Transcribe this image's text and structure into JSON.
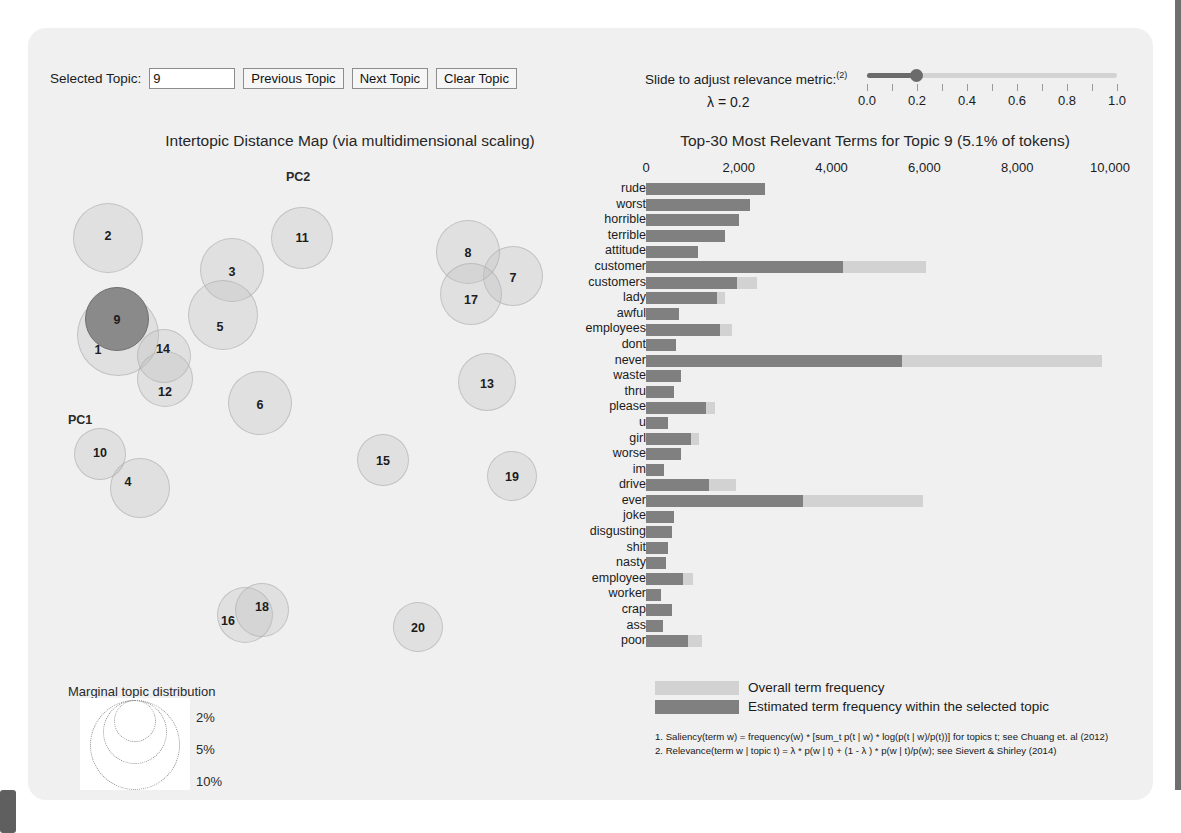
{
  "controls": {
    "selected_topic_label": "Selected Topic:",
    "selected_topic_value": "9",
    "previous_topic": "Previous Topic",
    "next_topic": "Next Topic",
    "clear_topic": "Clear Topic"
  },
  "slider": {
    "caption": "Slide to adjust relevance metric:",
    "caption_sup": "(2)",
    "lambda_text": "λ = 0.2",
    "value": 0.2,
    "min": 0.0,
    "max": 1.0,
    "ticks": [
      "0.0",
      "0.2",
      "0.4",
      "0.6",
      "0.8",
      "1.0"
    ],
    "tick_values": [
      0.0,
      0.1,
      0.2,
      0.3,
      0.4,
      0.5,
      0.6,
      0.7,
      0.8,
      0.9,
      1.0
    ],
    "fill_color": "#6b6b6b",
    "track_color": "#d3d3d3"
  },
  "map": {
    "title": "Intertopic Distance Map (via multidimensional scaling)",
    "axis_x_label": "PC1",
    "axis_y_label": "PC2",
    "selected_topic": 9,
    "selected_color": "#8a8a8a",
    "bubble_color": "rgba(190,190,190,0.30)",
    "topics": [
      {
        "id": 1,
        "cx": 78,
        "cy": 175,
        "r": 41,
        "lx": 58,
        "ly": 190
      },
      {
        "id": 2,
        "cx": 68,
        "cy": 78,
        "r": 35,
        "lx": 68,
        "ly": 76
      },
      {
        "id": 3,
        "cx": 192,
        "cy": 110,
        "r": 32,
        "lx": 192,
        "ly": 112
      },
      {
        "id": 4,
        "cx": 100,
        "cy": 328,
        "r": 30,
        "lx": 88,
        "ly": 322
      },
      {
        "id": 5,
        "cx": 183,
        "cy": 155,
        "r": 35,
        "lx": 180,
        "ly": 167
      },
      {
        "id": 6,
        "cx": 220,
        "cy": 243,
        "r": 32,
        "lx": 220,
        "ly": 245
      },
      {
        "id": 7,
        "cx": 473,
        "cy": 116,
        "r": 30,
        "lx": 473,
        "ly": 118
      },
      {
        "id": 8,
        "cx": 428,
        "cy": 92,
        "r": 32,
        "lx": 428,
        "ly": 93
      },
      {
        "id": 9,
        "cx": 77,
        "cy": 159,
        "r": 32,
        "lx": 77,
        "ly": 160
      },
      {
        "id": 10,
        "cx": 60,
        "cy": 294,
        "r": 26,
        "lx": 60,
        "ly": 293
      },
      {
        "id": 11,
        "cx": 262,
        "cy": 78,
        "r": 31,
        "lx": 262,
        "ly": 78
      },
      {
        "id": 12,
        "cx": 125,
        "cy": 219,
        "r": 28,
        "lx": 125,
        "ly": 232
      },
      {
        "id": 13,
        "cx": 447,
        "cy": 222,
        "r": 29,
        "lx": 447,
        "ly": 224
      },
      {
        "id": 14,
        "cx": 124,
        "cy": 196,
        "r": 27,
        "lx": 123,
        "ly": 189
      },
      {
        "id": 15,
        "cx": 343,
        "cy": 300,
        "r": 26,
        "lx": 343,
        "ly": 301
      },
      {
        "id": 16,
        "cx": 205,
        "cy": 455,
        "r": 28,
        "lx": 188,
        "ly": 461
      },
      {
        "id": 17,
        "cx": 431,
        "cy": 134,
        "r": 31,
        "lx": 431,
        "ly": 140
      },
      {
        "id": 18,
        "cx": 222,
        "cy": 450,
        "r": 27,
        "lx": 222,
        "ly": 447
      },
      {
        "id": 19,
        "cx": 472,
        "cy": 316,
        "r": 25,
        "lx": 472,
        "ly": 317
      },
      {
        "id": 20,
        "cx": 378,
        "cy": 467,
        "r": 25,
        "lx": 378,
        "ly": 468
      }
    ],
    "marginal_title": "Marginal topic distribution",
    "marginal_pcts": [
      "2%",
      "5%",
      "10%"
    ],
    "marginal_radii": [
      21,
      32,
      45
    ]
  },
  "chart_data": {
    "type": "bar",
    "title": "Top-30 Most Relevant Terms for Topic 9 (5.1% of tokens)",
    "topic_number": 9,
    "topic_token_pct": "5.1%",
    "xlabel": "",
    "ylabel": "",
    "xlim": [
      0,
      10000
    ],
    "xticks": [
      0,
      2000,
      4000,
      6000,
      8000,
      10000
    ],
    "xtick_labels": [
      "0",
      "2,000",
      "4,000",
      "6,000",
      "8,000",
      "10,000"
    ],
    "grid": false,
    "orientation": "horizontal",
    "categories": [
      "rude",
      "worst",
      "horrible",
      "terrible",
      "attitude",
      "customer",
      "customers",
      "lady",
      "awful",
      "employees",
      "dont",
      "never",
      "waste",
      "thru",
      "please",
      "u",
      "girl",
      "worse",
      "im",
      "drive",
      "ever",
      "joke",
      "disgusting",
      "shit",
      "nasty",
      "employee",
      "worker",
      "crap",
      "ass",
      "poor"
    ],
    "series": [
      {
        "name": "Overall term frequency",
        "color": "#d2d2d2",
        "values": [
          2560,
          2240,
          2010,
          1700,
          1130,
          6030,
          2400,
          1700,
          720,
          1850,
          650,
          9820,
          760,
          610,
          1480,
          480,
          1150,
          760,
          390,
          1950,
          5960,
          610,
          570,
          480,
          440,
          1020,
          330,
          550,
          370,
          1200
        ]
      },
      {
        "name": "Estimated term frequency within the selected topic",
        "color": "#808080",
        "values": [
          2560,
          2240,
          2010,
          1700,
          1130,
          4250,
          1960,
          1520,
          720,
          1590,
          650,
          5520,
          760,
          610,
          1300,
          480,
          980,
          760,
          390,
          1350,
          3380,
          610,
          570,
          480,
          440,
          800,
          330,
          550,
          370,
          910
        ]
      }
    ]
  },
  "legend": {
    "overall_label": "Overall term frequency",
    "topic_label": "Estimated term frequency within the selected topic"
  },
  "footnotes": {
    "line1": "1. Saliency(term w) = frequency(w) * [sum_t p(t | w) * log(p(t | w)/p(t))] for topics t; see Chuang et. al (2012)",
    "line2": "2. Relevance(term w | topic t) = λ * p(w | t) + (1 - λ ) * p(w | t)/p(w); see Sievert & Shirley (2014)"
  }
}
